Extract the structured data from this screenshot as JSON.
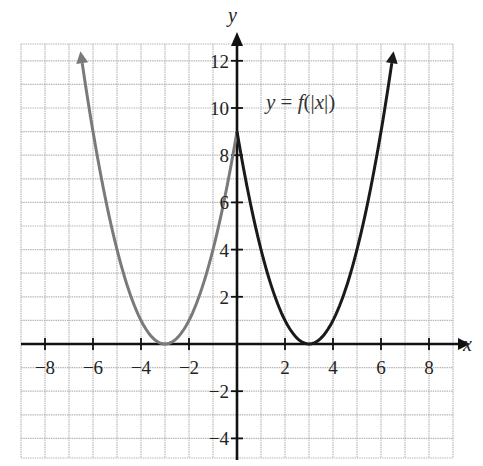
{
  "chart_data": {
    "type": "line",
    "title": "",
    "xlabel": "x",
    "ylabel": "y",
    "xlim": [
      -9,
      9
    ],
    "ylim": [
      -5,
      13
    ],
    "grid": true,
    "x_ticks": [
      -8,
      -6,
      -4,
      -2,
      2,
      4,
      6,
      8
    ],
    "x_tick_labels": [
      "−8",
      "−6",
      "−4",
      "−2",
      "2",
      "4",
      "6",
      "8"
    ],
    "y_ticks": [
      -4,
      -2,
      2,
      4,
      6,
      8,
      10,
      12
    ],
    "y_tick_labels": [
      "−4",
      "−2",
      "2",
      "4",
      "6",
      "8",
      "10",
      "12"
    ],
    "annotation": "y = f(|x|)",
    "series": [
      {
        "name": "f(|x|) for x < 0 (reflected)",
        "color": "#7a7a7a",
        "x": [
          -6.6,
          -6,
          -5,
          -4,
          -3,
          -2,
          -1,
          0
        ],
        "y": [
          12.96,
          9,
          4,
          1,
          0,
          1,
          4,
          9
        ]
      },
      {
        "name": "f(|x|) for x >= 0",
        "color": "#1a1a1a",
        "x": [
          0,
          1,
          2,
          3,
          4,
          5,
          6,
          6.6
        ],
        "y": [
          9,
          4,
          1,
          0,
          1,
          4,
          9,
          12.96
        ]
      }
    ]
  },
  "labels": {
    "x_axis": "x",
    "y_axis": "y",
    "equation": "y = f(|x|)"
  }
}
